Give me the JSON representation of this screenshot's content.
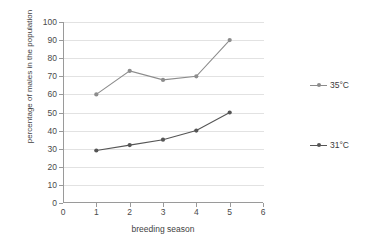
{
  "top_strip_text": "",
  "chart_data": {
    "type": "line",
    "title": "",
    "xlabel": "breeding season",
    "ylabel": "percentage of males in the population",
    "x": [
      1,
      2,
      3,
      4,
      5
    ],
    "xlim": [
      0,
      6
    ],
    "ylim": [
      0,
      100
    ],
    "xticks": [
      "0",
      "1",
      "2",
      "3",
      "4",
      "5",
      "6"
    ],
    "yticks": [
      "0",
      "10",
      "20",
      "30",
      "40",
      "50",
      "60",
      "70",
      "80",
      "90",
      "100"
    ],
    "grid": "horizontal",
    "legend_position": "right-outside",
    "series": [
      {
        "name": "35°C",
        "values": [
          60,
          73,
          68,
          70,
          90
        ],
        "color": "#8c8c8c"
      },
      {
        "name": "31°C",
        "values": [
          29,
          32,
          35,
          40,
          50
        ],
        "color": "#555555"
      }
    ]
  },
  "legend": {
    "items": [
      {
        "label": "35°C",
        "color": "#8c8c8c"
      },
      {
        "label": "31°C",
        "color": "#555555"
      }
    ]
  }
}
